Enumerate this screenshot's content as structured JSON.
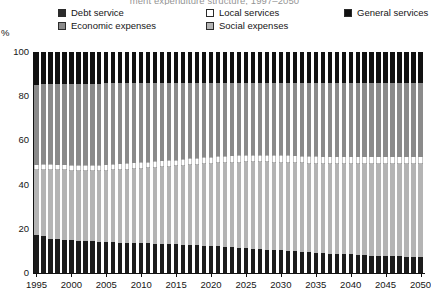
{
  "title": "ment expenditure structure, 1997–2050",
  "axis": {
    "y_unit": "%",
    "y_ticks": [
      "0",
      "20",
      "40",
      "60",
      "80",
      "100"
    ],
    "x_ticks": [
      "1995",
      "2000",
      "2005",
      "2010",
      "2015",
      "2020",
      "2025",
      "2030",
      "2035",
      "2040",
      "2045",
      "2050"
    ]
  },
  "legend": [
    {
      "label": "Debt service",
      "color": "#2b2b2b"
    },
    {
      "label": "Local services",
      "color": "#ffffff"
    },
    {
      "label": "General services",
      "color": "#111111"
    },
    {
      "label": "Economic expenses",
      "color": "#8a8a8a"
    },
    {
      "label": "Social expenses",
      "color": "#b4b4b4"
    }
  ],
  "chart_data": {
    "type": "bar",
    "title": "ment expenditure structure, 1997–2050",
    "subtype": "stacked-100-percent",
    "xlabel": "",
    "ylabel": "%",
    "ylim": [
      0,
      100
    ],
    "grid": false,
    "legend_position": "top",
    "categories": [
      1995,
      1996,
      1997,
      1998,
      1999,
      2000,
      2001,
      2002,
      2003,
      2004,
      2005,
      2006,
      2007,
      2008,
      2009,
      2010,
      2011,
      2012,
      2013,
      2014,
      2015,
      2016,
      2017,
      2018,
      2019,
      2020,
      2021,
      2022,
      2023,
      2024,
      2025,
      2026,
      2027,
      2028,
      2029,
      2030,
      2031,
      2032,
      2033,
      2034,
      2035,
      2036,
      2037,
      2038,
      2039,
      2040,
      2041,
      2042,
      2043,
      2044,
      2045,
      2046,
      2047,
      2048,
      2049,
      2050
    ],
    "stack_order_bottom_to_top": [
      "Debt service",
      "Social expenses",
      "Local services",
      "Economic expenses",
      "General services"
    ],
    "series": [
      {
        "name": "Debt service",
        "color": "#1c1c1c",
        "values": [
          17.0,
          16.8,
          15.6,
          15.2,
          15.0,
          14.8,
          14.6,
          14.4,
          14.3,
          14.1,
          14.0,
          13.9,
          13.8,
          13.7,
          13.6,
          13.5,
          13.4,
          13.3,
          13.2,
          13.1,
          13.0,
          12.9,
          12.8,
          12.6,
          12.4,
          12.2,
          12.0,
          11.8,
          11.6,
          11.4,
          11.2,
          11.0,
          10.8,
          10.6,
          10.4,
          10.2,
          10.0,
          9.8,
          9.6,
          9.4,
          9.2,
          9.0,
          8.8,
          8.7,
          8.6,
          8.4,
          8.2,
          8.0,
          7.9,
          7.8,
          7.7,
          7.6,
          7.5,
          7.4,
          7.3,
          7.2
        ]
      },
      {
        "name": "Social expenses",
        "color": "#b4b4b4",
        "values": [
          29.5,
          29.9,
          31.0,
          31.3,
          31.4,
          31.5,
          31.6,
          31.7,
          31.8,
          31.9,
          32.2,
          32.5,
          32.8,
          33.1,
          33.4,
          33.7,
          34.0,
          34.3,
          34.6,
          34.9,
          35.2,
          35.6,
          36.0,
          36.4,
          36.8,
          37.2,
          37.6,
          38.0,
          38.3,
          38.6,
          38.9,
          39.1,
          39.3,
          39.5,
          39.6,
          39.7,
          39.8,
          39.9,
          40.0,
          40.1,
          40.2,
          40.3,
          40.4,
          40.5,
          40.6,
          40.8,
          41.0,
          41.2,
          41.3,
          41.4,
          41.5,
          41.6,
          41.7,
          41.8,
          41.9,
          42.0
        ]
      },
      {
        "name": "Local services",
        "color": "#ffffff",
        "values": [
          2.6,
          2.6,
          2.6,
          2.6,
          2.6,
          2.6,
          2.7,
          2.7,
          2.7,
          2.7,
          2.8,
          2.8,
          2.8,
          2.8,
          2.9,
          2.9,
          2.9,
          2.9,
          3.0,
          3.0,
          3.0,
          3.0,
          3.1,
          3.1,
          3.1,
          3.1,
          3.2,
          3.2,
          3.2,
          3.2,
          3.3,
          3.3,
          3.3,
          3.3,
          3.3,
          3.4,
          3.4,
          3.4,
          3.4,
          3.4,
          3.4,
          3.4,
          3.4,
          3.4,
          3.4,
          3.4,
          3.4,
          3.4,
          3.4,
          3.4,
          3.4,
          3.4,
          3.4,
          3.4,
          3.4,
          3.4
        ]
      },
      {
        "name": "Economic expenses",
        "color": "#8a8a8a",
        "values": [
          35.9,
          36.2,
          36.3,
          36.4,
          36.6,
          36.8,
          36.8,
          36.9,
          36.9,
          37.0,
          36.9,
          36.7,
          36.5,
          36.3,
          36.0,
          35.8,
          35.6,
          35.4,
          35.1,
          34.9,
          34.7,
          34.4,
          34.0,
          33.8,
          33.6,
          33.4,
          33.1,
          32.9,
          32.8,
          32.7,
          32.5,
          32.5,
          32.5,
          32.5,
          32.6,
          32.6,
          32.7,
          32.8,
          32.9,
          33.0,
          33.1,
          33.2,
          33.3,
          33.3,
          33.3,
          33.3,
          33.3,
          33.3,
          33.3,
          33.3,
          33.3,
          33.3,
          33.3,
          33.3,
          33.3,
          33.3
        ]
      },
      {
        "name": "General services",
        "color": "#111111",
        "values": [
          15.0,
          14.5,
          14.5,
          14.5,
          14.4,
          14.3,
          14.3,
          14.3,
          14.3,
          14.3,
          14.1,
          14.1,
          14.1,
          14.1,
          14.1,
          14.1,
          14.1,
          14.1,
          14.1,
          14.1,
          14.1,
          14.1,
          14.1,
          14.1,
          14.1,
          14.1,
          14.1,
          14.1,
          14.1,
          14.1,
          14.1,
          14.1,
          14.1,
          14.1,
          14.1,
          14.1,
          14.1,
          14.0,
          14.1,
          14.1,
          14.1,
          14.1,
          14.1,
          14.1,
          14.1,
          14.1,
          14.1,
          14.1,
          14.1,
          14.1,
          14.1,
          14.1,
          14.1,
          14.1,
          14.1,
          14.1
        ]
      }
    ]
  }
}
